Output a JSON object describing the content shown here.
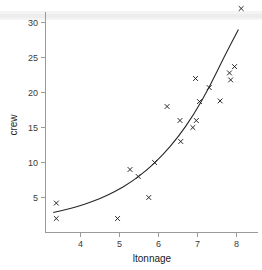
{
  "chart_data": {
    "type": "scatter",
    "title": "",
    "subtitle": "",
    "xlabel": "ltonnage",
    "ylabel": "crew",
    "xlim": [
      3.15,
      8.35
    ],
    "ylim": [
      0.6,
      33.2
    ],
    "xticks": [
      4,
      5,
      6,
      7,
      8
    ],
    "yticks": [
      5,
      10,
      15,
      20,
      25,
      30
    ],
    "xtick_labels": [
      "4",
      "5",
      "6",
      "7",
      "8"
    ],
    "ytick_labels": [
      "5",
      "10",
      "15",
      "20",
      "25",
      "30"
    ],
    "grid": false,
    "legend": null,
    "marker": "x",
    "marker_color": "#1d1d1d",
    "curve_color": "#262626",
    "background_color": "#ffffff",
    "axis_color": "#9a9a9a",
    "points": [
      {
        "x": 3.38,
        "y": 4.2
      },
      {
        "x": 3.38,
        "y": 2.0
      },
      {
        "x": 4.95,
        "y": 2.0
      },
      {
        "x": 5.27,
        "y": 9.0
      },
      {
        "x": 5.48,
        "y": 8.0
      },
      {
        "x": 5.75,
        "y": 5.0
      },
      {
        "x": 5.9,
        "y": 10.0
      },
      {
        "x": 6.22,
        "y": 18.0
      },
      {
        "x": 6.55,
        "y": 16.0
      },
      {
        "x": 6.57,
        "y": 13.0
      },
      {
        "x": 6.88,
        "y": 15.0
      },
      {
        "x": 6.95,
        "y": 22.0
      },
      {
        "x": 6.97,
        "y": 16.0
      },
      {
        "x": 7.05,
        "y": 18.7
      },
      {
        "x": 7.3,
        "y": 20.7
      },
      {
        "x": 7.58,
        "y": 18.8
      },
      {
        "x": 7.82,
        "y": 22.8
      },
      {
        "x": 7.85,
        "y": 21.8
      },
      {
        "x": 7.95,
        "y": 23.7
      },
      {
        "x": 8.12,
        "y": 32.0
      }
    ],
    "fit_curve": {
      "description": "exponential fit of crew on ltonnage",
      "x_start": 3.3,
      "x_end": 8.05,
      "points": [
        {
          "x": 3.3,
          "y": 2.85
        },
        {
          "x": 3.7,
          "y": 3.35
        },
        {
          "x": 4.1,
          "y": 4.0
        },
        {
          "x": 4.5,
          "y": 4.85
        },
        {
          "x": 4.9,
          "y": 5.9
        },
        {
          "x": 5.3,
          "y": 7.2
        },
        {
          "x": 5.7,
          "y": 8.9
        },
        {
          "x": 6.1,
          "y": 11.0
        },
        {
          "x": 6.5,
          "y": 13.6
        },
        {
          "x": 6.9,
          "y": 16.8
        },
        {
          "x": 7.3,
          "y": 20.7
        },
        {
          "x": 7.7,
          "y": 25.3
        },
        {
          "x": 8.05,
          "y": 29.0
        }
      ]
    },
    "annotations": [
      {
        "name": "top-banner-band",
        "type": "horizontal-band",
        "color": "#ededed"
      }
    ]
  }
}
